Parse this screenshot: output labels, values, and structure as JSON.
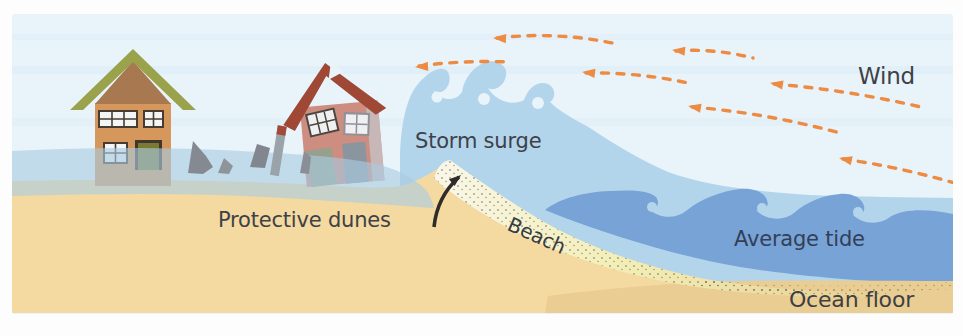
{
  "diagram": {
    "name": "Storm surge coastal cross-section diagram",
    "labels": {
      "wind": "Wind",
      "storm_surge": "Storm surge",
      "protective_dunes": "Protective dunes",
      "beach": "Beach",
      "average_tide": "Average tide",
      "ocean_floor": "Ocean floor"
    },
    "colors": {
      "sky": "#e8f3fa",
      "surge_water": "#b3d5ec",
      "tide_water": "#78a3d6",
      "flood_water": "#a9cbe2",
      "sand": "#f4d9a1",
      "ocean_floor_sand": "#e9cd93",
      "beach_sand_light": "#f5f1c4",
      "wind_arrow": "#ee8b42",
      "surge_arrow": "#2e2b28",
      "label_dark": "#3e4147",
      "label_navy": "#333f58",
      "house_intact_wall": "#d6975c",
      "house_intact_roof": "#9aa24b",
      "house_damaged_wall": "#cd8d80",
      "house_damaged_roof": "#a04836"
    }
  }
}
